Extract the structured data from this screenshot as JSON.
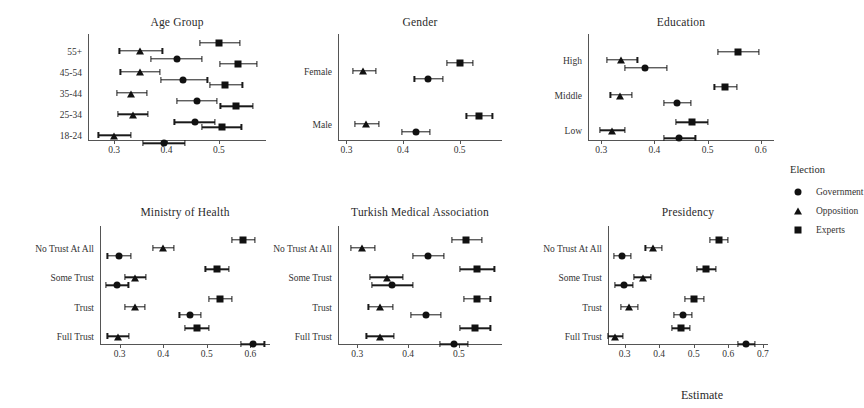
{
  "figure": {
    "x_axis_caption": "Estimate",
    "marker_colors": {
      "point": "#111111",
      "interval": "#1a1a1a"
    }
  },
  "legend": {
    "title": "Election",
    "entries": [
      {
        "label": "Government",
        "shape": "circle"
      },
      {
        "label": "Opposition",
        "shape": "triangle"
      },
      {
        "label": "Experts",
        "shape": "square"
      }
    ]
  },
  "chart_data": {
    "type": "scatter",
    "xlabel": "Estimate",
    "ylabel": "",
    "grid": false,
    "legend_position": "right",
    "legend_title": "Election",
    "series_names": [
      "Government",
      "Opposition",
      "Experts"
    ],
    "panels": [
      {
        "title": "Age Group",
        "categories": [
          "55+",
          "45-54",
          "35-44",
          "25-34",
          "18-24"
        ],
        "xticks": [
          0.3,
          0.4,
          0.5
        ],
        "xlim": [
          0.25,
          0.59
        ],
        "series": [
          {
            "name": "Government",
            "shape": "circle",
            "points": [
              {
                "category": "55+",
                "estimate": 0.42,
                "low": 0.37,
                "high": 0.468
              },
              {
                "category": "45-54",
                "estimate": 0.432,
                "low": 0.39,
                "high": 0.478
              },
              {
                "category": "35-44",
                "estimate": 0.458,
                "low": 0.42,
                "high": 0.497
              },
              {
                "category": "25-34",
                "estimate": 0.455,
                "low": 0.415,
                "high": 0.492
              },
              {
                "category": "18-24",
                "estimate": 0.395,
                "low": 0.355,
                "high": 0.435
              }
            ]
          },
          {
            "name": "Opposition",
            "shape": "triangle",
            "points": [
              {
                "category": "55+",
                "estimate": 0.35,
                "low": 0.31,
                "high": 0.392
              },
              {
                "category": "45-54",
                "estimate": 0.35,
                "low": 0.312,
                "high": 0.388
              },
              {
                "category": "35-44",
                "estimate": 0.333,
                "low": 0.305,
                "high": 0.362
              },
              {
                "category": "25-34",
                "estimate": 0.335,
                "low": 0.307,
                "high": 0.365
              },
              {
                "category": "18-24",
                "estimate": 0.3,
                "low": 0.27,
                "high": 0.332
              }
            ]
          },
          {
            "name": "Experts",
            "shape": "square",
            "points": [
              {
                "category": "55+",
                "estimate": 0.5,
                "low": 0.463,
                "high": 0.54
              },
              {
                "category": "45-54",
                "estimate": 0.537,
                "low": 0.502,
                "high": 0.572
              },
              {
                "category": "35-44",
                "estimate": 0.512,
                "low": 0.483,
                "high": 0.545
              },
              {
                "category": "25-34",
                "estimate": 0.533,
                "low": 0.503,
                "high": 0.565
              },
              {
                "category": "18-24",
                "estimate": 0.505,
                "low": 0.468,
                "high": 0.543
              }
            ]
          }
        ]
      },
      {
        "title": "Gender",
        "categories": [
          "Female",
          "Male"
        ],
        "xticks": [
          0.3,
          0.4,
          0.5
        ],
        "xlim": [
          0.285,
          0.575
        ],
        "series": [
          {
            "name": "Government",
            "shape": "circle",
            "points": [
              {
                "category": "Female",
                "estimate": 0.445,
                "low": 0.42,
                "high": 0.47
              },
              {
                "category": "Male",
                "estimate": 0.423,
                "low": 0.398,
                "high": 0.448
              }
            ]
          },
          {
            "name": "Opposition",
            "shape": "triangle",
            "points": [
              {
                "category": "Female",
                "estimate": 0.33,
                "low": 0.312,
                "high": 0.352
              },
              {
                "category": "Male",
                "estimate": 0.335,
                "low": 0.315,
                "high": 0.357
              }
            ]
          },
          {
            "name": "Experts",
            "shape": "square",
            "points": [
              {
                "category": "Female",
                "estimate": 0.5,
                "low": 0.477,
                "high": 0.523
              },
              {
                "category": "Male",
                "estimate": 0.535,
                "low": 0.512,
                "high": 0.558
              }
            ]
          }
        ]
      },
      {
        "title": "Education",
        "categories": [
          "High",
          "Middle",
          "Low"
        ],
        "xticks": [
          0.3,
          0.4,
          0.5,
          0.6
        ],
        "xlim": [
          0.275,
          0.625
        ],
        "series": [
          {
            "name": "Government",
            "shape": "circle",
            "points": [
              {
                "category": "High",
                "estimate": 0.383,
                "low": 0.345,
                "high": 0.423
              },
              {
                "category": "Middle",
                "estimate": 0.443,
                "low": 0.418,
                "high": 0.468
              },
              {
                "category": "Low",
                "estimate": 0.447,
                "low": 0.418,
                "high": 0.477
              }
            ]
          },
          {
            "name": "Opposition",
            "shape": "triangle",
            "points": [
              {
                "category": "High",
                "estimate": 0.338,
                "low": 0.31,
                "high": 0.368
              },
              {
                "category": "Middle",
                "estimate": 0.335,
                "low": 0.317,
                "high": 0.357
              },
              {
                "category": "Low",
                "estimate": 0.32,
                "low": 0.297,
                "high": 0.345
              }
            ]
          },
          {
            "name": "Experts",
            "shape": "square",
            "points": [
              {
                "category": "High",
                "estimate": 0.558,
                "low": 0.52,
                "high": 0.597
              },
              {
                "category": "Middle",
                "estimate": 0.533,
                "low": 0.513,
                "high": 0.555
              },
              {
                "category": "Low",
                "estimate": 0.47,
                "low": 0.44,
                "high": 0.5
              }
            ]
          }
        ]
      },
      {
        "title": "Ministry of Health",
        "categories": [
          "No Trust At All",
          "Some Trust",
          "Trust",
          "Full Trust"
        ],
        "xticks": [
          0.3,
          0.4,
          0.5,
          0.6
        ],
        "xlim": [
          0.255,
          0.645
        ],
        "series": [
          {
            "name": "Government",
            "shape": "circle",
            "points": [
              {
                "category": "No Trust At All",
                "estimate": 0.298,
                "low": 0.272,
                "high": 0.325
              },
              {
                "category": "Some Trust",
                "estimate": 0.293,
                "low": 0.268,
                "high": 0.32
              },
              {
                "category": "Trust",
                "estimate": 0.462,
                "low": 0.437,
                "high": 0.487
              },
              {
                "category": "Full Trust",
                "estimate": 0.605,
                "low": 0.578,
                "high": 0.632
              }
            ]
          },
          {
            "name": "Opposition",
            "shape": "triangle",
            "points": [
              {
                "category": "No Trust At All",
                "estimate": 0.4,
                "low": 0.377,
                "high": 0.425
              },
              {
                "category": "Some Trust",
                "estimate": 0.335,
                "low": 0.313,
                "high": 0.36
              },
              {
                "category": "Trust",
                "estimate": 0.335,
                "low": 0.312,
                "high": 0.358
              },
              {
                "category": "Full Trust",
                "estimate": 0.297,
                "low": 0.272,
                "high": 0.322
              }
            ]
          },
          {
            "name": "Experts",
            "shape": "square",
            "points": [
              {
                "category": "No Trust At All",
                "estimate": 0.583,
                "low": 0.557,
                "high": 0.61
              },
              {
                "category": "Some Trust",
                "estimate": 0.523,
                "low": 0.497,
                "high": 0.55
              },
              {
                "category": "Trust",
                "estimate": 0.53,
                "low": 0.505,
                "high": 0.557
              },
              {
                "category": "Full Trust",
                "estimate": 0.478,
                "low": 0.45,
                "high": 0.505
              }
            ]
          }
        ]
      },
      {
        "title": "Turkish Medical Association",
        "categories": [
          "No Trust At All",
          "Some Trust",
          "Trust",
          "Full Trust"
        ],
        "xticks": [
          0.3,
          0.4,
          0.5
        ],
        "xlim": [
          0.262,
          0.585
        ],
        "series": [
          {
            "name": "Government",
            "shape": "circle",
            "points": [
              {
                "category": "No Trust At All",
                "estimate": 0.44,
                "low": 0.41,
                "high": 0.47
              },
              {
                "category": "Some Trust",
                "estimate": 0.368,
                "low": 0.328,
                "high": 0.41
              },
              {
                "category": "Trust",
                "estimate": 0.435,
                "low": 0.405,
                "high": 0.465
              },
              {
                "category": "Full Trust",
                "estimate": 0.49,
                "low": 0.462,
                "high": 0.518
              }
            ]
          },
          {
            "name": "Opposition",
            "shape": "triangle",
            "points": [
              {
                "category": "No Trust At All",
                "estimate": 0.31,
                "low": 0.288,
                "high": 0.335
              },
              {
                "category": "Some Trust",
                "estimate": 0.358,
                "low": 0.325,
                "high": 0.39
              },
              {
                "category": "Trust",
                "estimate": 0.345,
                "low": 0.322,
                "high": 0.37
              },
              {
                "category": "Full Trust",
                "estimate": 0.345,
                "low": 0.318,
                "high": 0.372
              }
            ]
          },
          {
            "name": "Experts",
            "shape": "square",
            "points": [
              {
                "category": "No Trust At All",
                "estimate": 0.515,
                "low": 0.487,
                "high": 0.545
              },
              {
                "category": "Some Trust",
                "estimate": 0.535,
                "low": 0.502,
                "high": 0.57
              },
              {
                "category": "Trust",
                "estimate": 0.535,
                "low": 0.51,
                "high": 0.562
              },
              {
                "category": "Full Trust",
                "estimate": 0.532,
                "low": 0.502,
                "high": 0.562
              }
            ]
          }
        ]
      },
      {
        "title": "Presidency",
        "categories": [
          "No Trust At All",
          "Some Trust",
          "Trust",
          "Full Trust"
        ],
        "xticks": [
          0.3,
          0.4,
          0.5,
          0.6,
          0.7
        ],
        "xlim": [
          0.252,
          0.715
        ],
        "series": [
          {
            "name": "Government",
            "shape": "circle",
            "points": [
              {
                "category": "No Trust At All",
                "estimate": 0.292,
                "low": 0.27,
                "high": 0.318
              },
              {
                "category": "Some Trust",
                "estimate": 0.297,
                "low": 0.272,
                "high": 0.323
              },
              {
                "category": "Trust",
                "estimate": 0.468,
                "low": 0.442,
                "high": 0.495
              },
              {
                "category": "Full Trust",
                "estimate": 0.652,
                "low": 0.628,
                "high": 0.678
              }
            ]
          },
          {
            "name": "Opposition",
            "shape": "triangle",
            "points": [
              {
                "category": "No Trust At All",
                "estimate": 0.383,
                "low": 0.36,
                "high": 0.407
              },
              {
                "category": "Some Trust",
                "estimate": 0.352,
                "low": 0.328,
                "high": 0.377
              },
              {
                "category": "Trust",
                "estimate": 0.313,
                "low": 0.29,
                "high": 0.338
              },
              {
                "category": "Full Trust",
                "estimate": 0.272,
                "low": 0.252,
                "high": 0.295
              }
            ]
          },
          {
            "name": "Experts",
            "shape": "square",
            "points": [
              {
                "category": "No Trust At All",
                "estimate": 0.572,
                "low": 0.548,
                "high": 0.598
              },
              {
                "category": "Some Trust",
                "estimate": 0.537,
                "low": 0.51,
                "high": 0.565
              },
              {
                "category": "Trust",
                "estimate": 0.502,
                "low": 0.475,
                "high": 0.53
              },
              {
                "category": "Full Trust",
                "estimate": 0.463,
                "low": 0.437,
                "high": 0.49
              }
            ]
          }
        ]
      }
    ]
  }
}
